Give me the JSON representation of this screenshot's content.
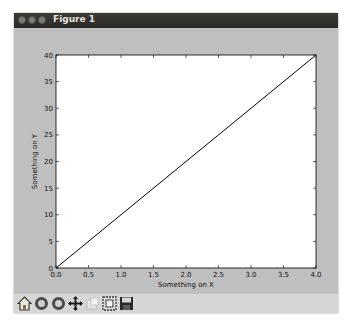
{
  "window": {
    "title": "Figure 1",
    "titlebar_buttons": [
      "close",
      "minimize",
      "maximize"
    ]
  },
  "toolbar": {
    "items": [
      {
        "name": "home",
        "label": "Home"
      },
      {
        "name": "back",
        "label": "Back"
      },
      {
        "name": "forward",
        "label": "Forward"
      },
      {
        "name": "pan",
        "label": "Pan"
      },
      {
        "name": "zoom",
        "label": "Zoom"
      },
      {
        "name": "subplots",
        "label": "Configure subplots"
      },
      {
        "name": "save",
        "label": "Save"
      }
    ]
  },
  "chart_data": {
    "type": "line",
    "title": "",
    "xlabel": "Something on X",
    "ylabel": "Something on Y",
    "xlim": [
      0,
      4
    ],
    "ylim": [
      0,
      40
    ],
    "xticks": [
      "0.0",
      "0.5",
      "1.0",
      "1.5",
      "2.0",
      "2.5",
      "3.0",
      "3.5",
      "4.0"
    ],
    "yticks": [
      "0",
      "5",
      "10",
      "15",
      "20",
      "25",
      "30",
      "35",
      "40"
    ],
    "grid": false,
    "legend": null,
    "series": [
      {
        "name": "line",
        "x": [
          0,
          4
        ],
        "y": [
          0,
          40
        ],
        "color": "#000000"
      }
    ]
  }
}
